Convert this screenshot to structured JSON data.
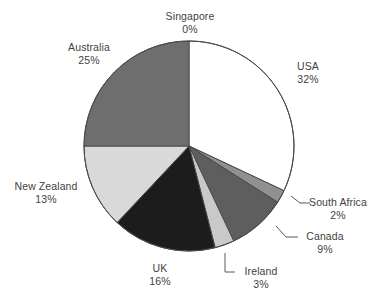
{
  "chart_data": {
    "type": "pie",
    "title": "",
    "xlabel": "",
    "ylabel": "",
    "legend_position": "none",
    "grid": false,
    "units": "percent",
    "start_angle_deg": 0,
    "direction": "clockwise",
    "categories": [
      "Singapore",
      "USA",
      "South Africa",
      "Canada",
      "Ireland",
      "UK",
      "New Zealand",
      "Australia"
    ],
    "values": [
      0,
      32,
      2,
      9,
      3,
      16,
      13,
      25
    ],
    "slices": [
      {
        "label": "Singapore",
        "value": 0,
        "value_label": "0%",
        "color": "#ffffff",
        "label_style": "direct"
      },
      {
        "label": "USA",
        "value": 32,
        "value_label": "32%",
        "color": "#ffffff",
        "label_style": "direct"
      },
      {
        "label": "South Africa",
        "value": 2,
        "value_label": "2%",
        "color": "#909090",
        "label_style": "leader"
      },
      {
        "label": "Canada",
        "value": 9,
        "value_label": "9%",
        "color": "#5e5e5e",
        "label_style": "leader"
      },
      {
        "label": "Ireland",
        "value": 3,
        "value_label": "3%",
        "color": "#c9c9c9",
        "label_style": "leader"
      },
      {
        "label": "UK",
        "value": 16,
        "value_label": "16%",
        "color": "#1c1c1c",
        "label_style": "direct"
      },
      {
        "label": "New Zealand",
        "value": 13,
        "value_label": "13%",
        "color": "#d9d9d9",
        "label_style": "direct"
      },
      {
        "label": "Australia",
        "value": 25,
        "value_label": "25%",
        "color": "#6e6e6e",
        "label_style": "direct"
      }
    ],
    "outline_color": "#4a4a4a",
    "leader_line_color": "#5a5a5a"
  }
}
